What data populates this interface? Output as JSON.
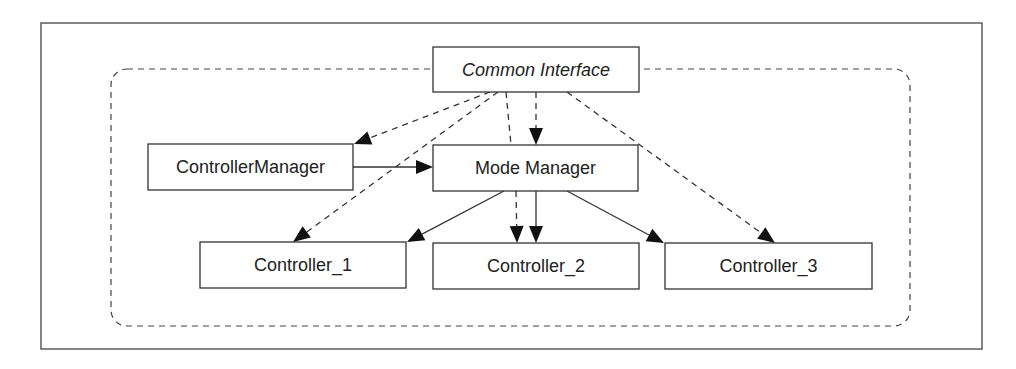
{
  "diagram": {
    "type": "architecture",
    "frame": {
      "x": 41,
      "y": 23,
      "w": 941,
      "h": 326
    },
    "region": {
      "x": 111,
      "y": 69,
      "w": 799,
      "h": 257,
      "r": 16,
      "style": "dashed"
    },
    "nodes": [
      {
        "id": "common_interface",
        "label": "Common Interface",
        "italic": true,
        "x": 433,
        "y": 47,
        "w": 206,
        "h": 45
      },
      {
        "id": "controller_manager",
        "label": "ControllerManager",
        "italic": false,
        "x": 148,
        "y": 144,
        "w": 205,
        "h": 46
      },
      {
        "id": "mode_manager",
        "label": "Mode Manager",
        "italic": false,
        "x": 433,
        "y": 145,
        "w": 205,
        "h": 46
      },
      {
        "id": "controller_1",
        "label": "Controller_1",
        "italic": false,
        "x": 200,
        "y": 242,
        "w": 206,
        "h": 46
      },
      {
        "id": "controller_2",
        "label": "Controller_2",
        "italic": false,
        "x": 433,
        "y": 243,
        "w": 206,
        "h": 46
      },
      {
        "id": "controller_3",
        "label": "Controller_3",
        "italic": false,
        "x": 665,
        "y": 243,
        "w": 207,
        "h": 46
      }
    ],
    "edges": [
      {
        "from": "common_interface",
        "to": "controller_manager",
        "style": "dashed",
        "x1": 490,
        "y1": 92,
        "x2": 354,
        "y2": 144
      },
      {
        "from": "common_interface",
        "to": "controller_1",
        "style": "dashed",
        "x1": 498,
        "y1": 92,
        "x2": 293,
        "y2": 242
      },
      {
        "from": "common_interface",
        "to": "mode_manager",
        "style": "dashed",
        "x1": 536,
        "y1": 92,
        "x2": 536,
        "y2": 145
      },
      {
        "from": "common_interface",
        "to": "controller_2",
        "style": "dashed",
        "x1": 506,
        "y1": 92,
        "x2": 511,
        "y2": 145,
        "continues": {
          "x1": 516,
          "y1": 191,
          "x2": 517,
          "y2": 243
        }
      },
      {
        "from": "common_interface",
        "to": "controller_3",
        "style": "dashed",
        "x1": 567,
        "y1": 92,
        "x2": 775,
        "y2": 243
      },
      {
        "from": "controller_manager",
        "to": "mode_manager",
        "style": "solid",
        "x1": 353,
        "y1": 167,
        "x2": 433,
        "y2": 167
      },
      {
        "from": "mode_manager",
        "to": "controller_1",
        "style": "solid",
        "x1": 504,
        "y1": 191,
        "x2": 407,
        "y2": 242
      },
      {
        "from": "mode_manager",
        "to": "controller_2",
        "style": "solid",
        "x1": 536,
        "y1": 191,
        "x2": 536,
        "y2": 243
      },
      {
        "from": "mode_manager",
        "to": "controller_3",
        "style": "solid",
        "x1": 567,
        "y1": 191,
        "x2": 664,
        "y2": 243
      }
    ]
  }
}
